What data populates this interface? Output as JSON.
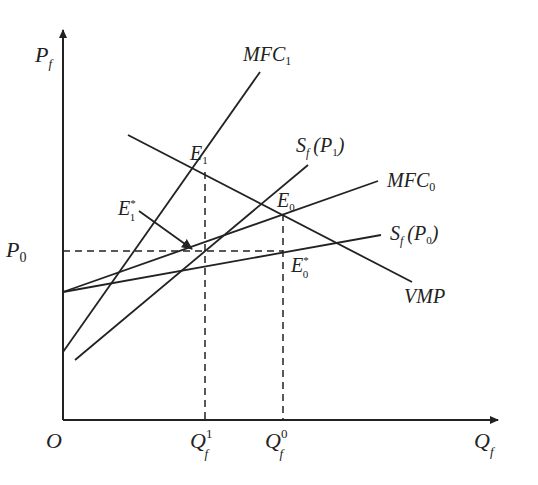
{
  "diagram": {
    "type": "economics-factor-market",
    "axes": {
      "y_label": "P",
      "y_sub": "f",
      "x_label": "Q",
      "x_sub": "f",
      "origin": "O"
    },
    "price_level": {
      "label": "P",
      "sub": "0"
    },
    "quantities": [
      {
        "label": "Q",
        "sub": "f",
        "sup": "1"
      },
      {
        "label": "Q",
        "sub": "f",
        "sup": "0"
      }
    ],
    "curves": {
      "mfc1": {
        "label": "MFC",
        "sub": "1"
      },
      "mfc0": {
        "label": "MFC",
        "sub": "0"
      },
      "sf_p1": {
        "label": "S",
        "sub": "f",
        "arg": "(P",
        "arg_sub": "1",
        "close": ")"
      },
      "sf_p0": {
        "label": "S",
        "sub": "f",
        "arg": "(P",
        "arg_sub": "0",
        "close": ")"
      },
      "vmp": {
        "label": "VMP"
      }
    },
    "points": {
      "e1": {
        "label": "E",
        "sub": "1"
      },
      "e0": {
        "label": "E",
        "sub": "0"
      },
      "e1_star": {
        "label": "E",
        "sub": "1",
        "sup": "*"
      },
      "e0_star": {
        "label": "E",
        "sub": "0",
        "sup": "*"
      }
    },
    "colors": {
      "line": "#222222",
      "background": "#ffffff"
    }
  }
}
